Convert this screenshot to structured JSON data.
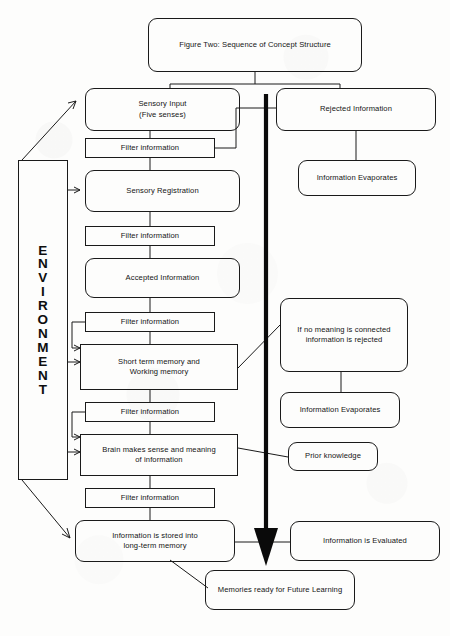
{
  "figure": {
    "title": "Figure Two: Sequence of Concept Structure",
    "environment_label": "ENVIRONMENT",
    "environment_letters": [
      "E",
      "N",
      "V",
      "I",
      "R",
      "O",
      "N",
      "M",
      "E",
      "N",
      "T"
    ]
  },
  "nodes": {
    "title_box": {
      "text": "Figure Two: Sequence of Concept Structure",
      "shape": "rounded"
    },
    "sensory_input": {
      "line1": "Sensory Input",
      "line2": "(Five senses)",
      "shape": "rounded"
    },
    "rejected_information": {
      "text": "Rejected Information",
      "shape": "rounded"
    },
    "information_evaporates_top": {
      "text": "Information Evaporates",
      "shape": "rounded"
    },
    "filter_1": {
      "text": "Filter information",
      "shape": "rect"
    },
    "sensory_registration": {
      "text": "Sensory Registration",
      "shape": "rounded"
    },
    "filter_2": {
      "text": "Filter information",
      "shape": "rect"
    },
    "accepted_information": {
      "text": "Accepted Information",
      "shape": "rounded"
    },
    "filter_3": {
      "text": "Filter information",
      "shape": "rect"
    },
    "short_term_memory": {
      "line1": "Short term memory and",
      "line2": "Working memory",
      "shape": "rect"
    },
    "no_meaning_rejected": {
      "line1": "If no meaning is connected",
      "line2": "information is rejected",
      "shape": "rounded"
    },
    "information_evaporates_bottom": {
      "text": "Information Evaporates",
      "shape": "rounded"
    },
    "filter_4": {
      "text": "Filter information",
      "shape": "rect"
    },
    "brain_makes_sense": {
      "line1": "Brain makes sense and meaning",
      "line2": "of information",
      "shape": "rect"
    },
    "prior_knowledge": {
      "text": "Prior knowledge",
      "shape": "rounded"
    },
    "filter_5": {
      "text": "Filter information",
      "shape": "rect"
    },
    "long_term_memory": {
      "line1": "Information is stored into",
      "line2": "long-term memory",
      "shape": "rounded"
    },
    "information_evaluated": {
      "text": "Information is Evaluated",
      "shape": "rounded"
    },
    "memories_future_learning": {
      "text": "Memories ready for Future Learning",
      "shape": "rounded"
    }
  },
  "colors": {
    "stroke": "#1a1a1a",
    "text": "#141414",
    "background": "#fdfdfc",
    "thick_arrow": "#0a0a0a"
  }
}
